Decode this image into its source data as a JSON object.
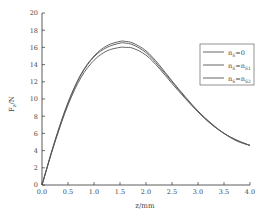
{
  "chart_data": {
    "type": "line",
    "title": "",
    "xlabel": "z/mm",
    "ylabel": "Fz/N",
    "xlim": [
      0,
      4.0
    ],
    "ylim": [
      0,
      20
    ],
    "xticks": [
      "0.0",
      "0.5",
      "1.0",
      "1.5",
      "2.0",
      "2.5",
      "3.0",
      "3.5",
      "4.0"
    ],
    "yticks": [
      "0",
      "2",
      "4",
      "6",
      "8",
      "10",
      "12",
      "14",
      "16",
      "18",
      "20"
    ],
    "grid": false,
    "legend_position": "upper right",
    "x": [
      0.0,
      0.25,
      0.5,
      0.75,
      1.0,
      1.25,
      1.5,
      1.6,
      1.75,
      2.0,
      2.25,
      2.5,
      2.75,
      3.0,
      3.25,
      3.5,
      3.75,
      4.0
    ],
    "series": [
      {
        "name": "nS=0",
        "values": [
          0.0,
          5.2,
          9.6,
          12.9,
          15.0,
          16.2,
          16.7,
          16.7,
          16.5,
          15.6,
          14.0,
          12.1,
          10.3,
          8.6,
          7.2,
          6.0,
          5.2,
          4.6
        ]
      },
      {
        "name": "nS=nS1",
        "values": [
          0.0,
          5.1,
          9.5,
          12.8,
          14.9,
          16.0,
          16.5,
          16.5,
          16.3,
          15.4,
          13.8,
          12.0,
          10.2,
          8.5,
          7.1,
          6.0,
          5.2,
          4.6
        ]
      },
      {
        "name": "nS=nS2",
        "values": [
          0.0,
          5.0,
          9.3,
          12.5,
          14.5,
          15.6,
          16.0,
          16.0,
          15.9,
          15.1,
          13.6,
          11.8,
          10.1,
          8.5,
          7.1,
          6.0,
          5.1,
          4.6
        ]
      }
    ]
  },
  "axes": {
    "xlabel": "z/mm",
    "ylabel_main": "F",
    "ylabel_sub": "z",
    "ylabel_unit": "/N"
  },
  "legend": [
    {
      "main": "n",
      "sub": "S",
      "rest": "=0"
    },
    {
      "main": "n",
      "sub": "S",
      "rest": "=n",
      "sub2": "S1"
    },
    {
      "main": "n",
      "sub": "S",
      "rest": "=n",
      "sub2": "S2"
    }
  ],
  "colors": {
    "line": "#555555",
    "axis": "#333333"
  }
}
